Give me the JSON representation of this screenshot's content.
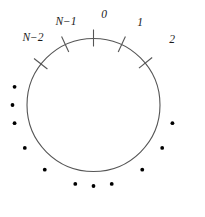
{
  "figure": {
    "colors": {
      "background": "#ffffff",
      "circle_stroke": "#555555",
      "tick_stroke": "#555555",
      "dot_fill": "#000000",
      "label_text": "#1a1a1a"
    },
    "circle": {
      "center_x": 93.5,
      "center_y": 105,
      "radius": 66.5,
      "stroke_width": 1.1
    },
    "ticks": [
      {
        "id": "tick-n-minus-2",
        "label": "N−2",
        "angle_deg": 142,
        "label_x": 33,
        "label_y": 38,
        "inner_extent": 8,
        "outer_extent": 9
      },
      {
        "id": "tick-n-minus-1",
        "label": "N−1",
        "angle_deg": 115,
        "label_x": 66,
        "label_y": 22,
        "inner_extent": 8,
        "outer_extent": 9
      },
      {
        "id": "tick-0",
        "label": "0",
        "angle_deg": 90,
        "label_x": 104,
        "label_y": 15,
        "inner_extent": 8,
        "outer_extent": 9
      },
      {
        "id": "tick-1",
        "label": "1",
        "angle_deg": 65,
        "label_x": 140,
        "label_y": 23,
        "inner_extent": 8,
        "outer_extent": 9
      },
      {
        "id": "tick-2",
        "label": "2",
        "angle_deg": 39,
        "label_x": 172,
        "label_y": 40,
        "inner_extent": 8,
        "outer_extent": 9
      }
    ],
    "dots": {
      "count": 11,
      "radius": 1.9,
      "orbit_radius": 81,
      "angles_deg": [
        167,
        180,
        193,
        212,
        233,
        257,
        270,
        283,
        307,
        328,
        347
      ]
    }
  }
}
